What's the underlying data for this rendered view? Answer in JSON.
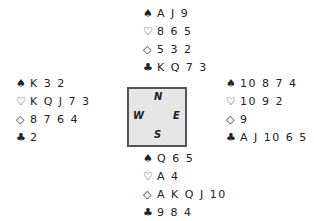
{
  "suits": {
    "spade": "♠",
    "heart": "♡",
    "diamond": "◇",
    "club": "♣"
  },
  "north": {
    "spades": "A J 9",
    "hearts": "8 6 5",
    "diamonds": "5 3 2",
    "clubs": "K Q 7 3"
  },
  "west": {
    "spades": "K 3 2",
    "hearts": "K Q J 7 3",
    "diamonds": "8 7 6 4",
    "clubs": "2"
  },
  "east": {
    "spades": "10 8 7 4",
    "hearts": "10 9 2",
    "diamonds": "9",
    "clubs": "A J 10 6 5"
  },
  "south": {
    "spades": "Q 6 5",
    "hearts": "A 4",
    "diamonds": "A K Q J 10",
    "clubs": "9 8 4"
  },
  "compass": {
    "n": "N",
    "e": "E",
    "s": "S",
    "w": "W"
  }
}
